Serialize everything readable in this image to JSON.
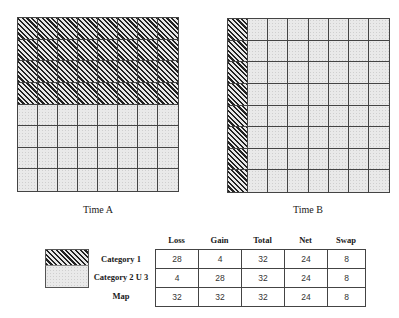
{
  "diagram": {
    "grid_size": {
      "rows": 8,
      "cols": 8
    },
    "time_a": {
      "caption": "Time A",
      "description": "Top 4 rows Category 1 (hatched), bottom 4 rows Category 2 U 3 (dotted)",
      "cells": [
        [
          "c1",
          "c1",
          "c1",
          "c1",
          "c1",
          "c1",
          "c1",
          "c1"
        ],
        [
          "c1",
          "c1",
          "c1",
          "c1",
          "c1",
          "c1",
          "c1",
          "c1"
        ],
        [
          "c1",
          "c1",
          "c1",
          "c1",
          "c1",
          "c1",
          "c1",
          "c1"
        ],
        [
          "c1",
          "c1",
          "c1",
          "c1",
          "c1",
          "c1",
          "c1",
          "c1"
        ],
        [
          "c2",
          "c2",
          "c2",
          "c2",
          "c2",
          "c2",
          "c2",
          "c2"
        ],
        [
          "c2",
          "c2",
          "c2",
          "c2",
          "c2",
          "c2",
          "c2",
          "c2"
        ],
        [
          "c2",
          "c2",
          "c2",
          "c2",
          "c2",
          "c2",
          "c2",
          "c2"
        ],
        [
          "c2",
          "c2",
          "c2",
          "c2",
          "c2",
          "c2",
          "c2",
          "c2"
        ]
      ]
    },
    "time_b": {
      "caption": "Time B",
      "description": "Leftmost column Category 1 (hatched), remaining 7 columns Category 2 U 3 (dotted)",
      "cells": [
        [
          "c1",
          "c2",
          "c2",
          "c2",
          "c2",
          "c2",
          "c2",
          "c2"
        ],
        [
          "c1",
          "c2",
          "c2",
          "c2",
          "c2",
          "c2",
          "c2",
          "c2"
        ],
        [
          "c1",
          "c2",
          "c2",
          "c2",
          "c2",
          "c2",
          "c2",
          "c2"
        ],
        [
          "c1",
          "c2",
          "c2",
          "c2",
          "c2",
          "c2",
          "c2",
          "c2"
        ],
        [
          "c1",
          "c2",
          "c2",
          "c2",
          "c2",
          "c2",
          "c2",
          "c2"
        ],
        [
          "c1",
          "c2",
          "c2",
          "c2",
          "c2",
          "c2",
          "c2",
          "c2"
        ],
        [
          "c1",
          "c2",
          "c2",
          "c2",
          "c2",
          "c2",
          "c2",
          "c2"
        ],
        [
          "c1",
          "c2",
          "c2",
          "c2",
          "c2",
          "c2",
          "c2",
          "c2"
        ]
      ]
    },
    "legend": [
      {
        "key": "c1",
        "label": "Category 1",
        "pattern": "diagonal-hatch"
      },
      {
        "key": "c2",
        "label": "Category 2 U 3",
        "pattern": "light-dotted"
      }
    ],
    "table": {
      "columns": [
        "Loss",
        "Gain",
        "Total",
        "Net",
        "Swap"
      ],
      "rows": [
        {
          "label": "Category 1",
          "values": [
            "28",
            "4",
            "32",
            "24",
            "8"
          ]
        },
        {
          "label": "Category 2 U 3",
          "values": [
            "4",
            "28",
            "32",
            "24",
            "8"
          ]
        },
        {
          "label": "Map",
          "values": [
            "32",
            "32",
            "32",
            "24",
            "8"
          ]
        }
      ]
    },
    "colors": {
      "line": "#444444",
      "hatch": "#222222",
      "dot_fill": "#e9e9e9"
    }
  }
}
